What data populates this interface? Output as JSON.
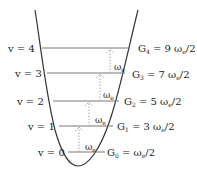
{
  "diagram": {
    "levels": [
      {
        "v_label": "v = 4",
        "energy_label": "G",
        "sub": "4",
        "eq": " = 9 ω",
        "eq_sub": "e",
        "tail": "/2",
        "y": 48
      },
      {
        "v_label": "v = 3",
        "energy_label": "G",
        "sub": "3",
        "eq": " = 7 ω",
        "eq_sub": "e",
        "tail": "/2",
        "y": 73
      },
      {
        "v_label": "v = 2",
        "energy_label": "G",
        "sub": "2",
        "eq": " = 5 ω",
        "eq_sub": "e",
        "tail": "/2",
        "y": 101
      },
      {
        "v_label": "v = 1",
        "energy_label": "G",
        "sub": "1",
        "eq": " = 3 ω",
        "eq_sub": "e",
        "tail": "/2",
        "y": 126
      },
      {
        "v_label": "v = 0",
        "energy_label": "G",
        "sub": "0",
        "eq": " = ω",
        "eq_sub": "e",
        "tail": "/2",
        "y": 152
      }
    ],
    "spacing_label": "ω",
    "spacing_sub": "e",
    "colors": {
      "curve": "#333333",
      "level_line": "#777777",
      "arrow": "#aaaaaa",
      "text": "#222222"
    }
  }
}
